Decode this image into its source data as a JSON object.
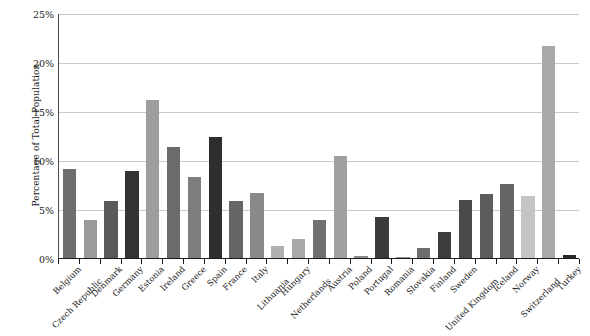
{
  "chart_data": {
    "type": "bar",
    "title": "",
    "xlabel": "",
    "ylabel": "Percentage of Total Population",
    "ylim": [
      0,
      25
    ],
    "ytick_labels": [
      "0%",
      "5%",
      "10%",
      "15%",
      "20%",
      "25%"
    ],
    "ytick_values": [
      0,
      5,
      10,
      15,
      20,
      25
    ],
    "grid": true,
    "legend": "none",
    "categories": [
      "Belgium",
      "Czech Republic",
      "Denmark",
      "Germany",
      "Estonia",
      "Ireland",
      "Greece",
      "Spain",
      "France",
      "Italy",
      "Lithuania",
      "Hungary",
      "Netherlands",
      "Austria",
      "Poland",
      "Portugal",
      "Romania",
      "Slovakia",
      "Finland",
      "Sweden",
      "United Kingdom",
      "Iceland",
      "Norway",
      "Switzerland",
      "Turkey"
    ],
    "values": [
      9.1,
      3.9,
      5.8,
      8.9,
      16.1,
      11.3,
      8.3,
      12.3,
      5.8,
      6.6,
      1.2,
      1.9,
      3.9,
      10.4,
      0.2,
      4.2,
      0.1,
      1.0,
      2.7,
      5.9,
      6.5,
      7.6,
      6.3,
      21.6,
      0.3
    ],
    "bar_colors": [
      "#6e6e6e",
      "#9a9a9a",
      "#5a5a5a",
      "#333333",
      "#9e9e9e",
      "#6b6b6b",
      "#7e7e7e",
      "#2e2e2e",
      "#666666",
      "#8a8a8a",
      "#b0b0b0",
      "#a8a8a8",
      "#707070",
      "#a0a0a0",
      "#8a8a8a",
      "#3a3a3a",
      "#909090",
      "#6e6e6e",
      "#3c3c3c",
      "#4a4a4a",
      "#5c5c5c",
      "#666666",
      "#c4c4c4",
      "#a8a8a8",
      "#2a2a2a"
    ],
    "label_wrap_row2": [
      false,
      true,
      false,
      false,
      false,
      false,
      false,
      false,
      false,
      false,
      true,
      false,
      true,
      false,
      false,
      false,
      false,
      false,
      false,
      false,
      true,
      false,
      false,
      true,
      false
    ]
  }
}
